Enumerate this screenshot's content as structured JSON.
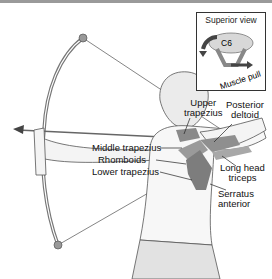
{
  "figure": {
    "labels": {
      "upper_trapezius": "Upper\ntrapezius",
      "posterior_deltoid": "Posterior\ndeltoid",
      "middle_trapezius": "Middle trapezius",
      "rhomboids": "Rhomboids",
      "lower_trapezius": "Lower trapezius",
      "long_head_triceps": "Long head\ntriceps",
      "serratus_anterior": "Serratus\nanterior"
    },
    "inset": {
      "title": "Superior view",
      "vertebra": "C6",
      "arrow_label": "Muscle pull"
    },
    "colors": {
      "muscle": "#8a8a8a",
      "skin": "#f4f4f4",
      "outline": "#555555",
      "bow": "#777777",
      "pants": "#e2e2e2"
    }
  }
}
